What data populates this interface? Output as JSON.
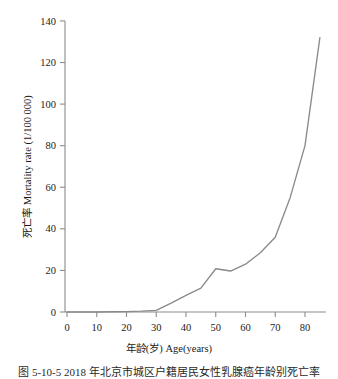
{
  "chart_data": {
    "type": "line",
    "title": "",
    "xlabel": "年龄(岁) Age(years)",
    "ylabel": "死亡率 Mortality rate (1/100 000)",
    "xlim": [
      0,
      87
    ],
    "ylim": [
      0,
      140
    ],
    "xticks": [
      0,
      10,
      20,
      30,
      40,
      50,
      60,
      70,
      80
    ],
    "yticks": [
      0,
      20,
      40,
      60,
      80,
      100,
      120,
      140
    ],
    "xtick_labels": [
      "0",
      "10",
      "20",
      "30",
      "40",
      "50",
      "60",
      "70",
      "80"
    ],
    "ytick_labels": [
      "0",
      "20",
      "40",
      "60",
      "80",
      "100",
      "120",
      "140"
    ],
    "grid": false,
    "legend": false,
    "line_color": "#8a8a8a",
    "axis_color": "#8c8c8c",
    "series": [
      {
        "name": "Mortality rate",
        "x": [
          0,
          5,
          10,
          15,
          20,
          25,
          30,
          35,
          40,
          45,
          50,
          55,
          60,
          65,
          70,
          75,
          80,
          85
        ],
        "values": [
          0.0,
          0.0,
          0.0,
          0.1,
          0.2,
          0.4,
          0.8,
          4.3,
          8.0,
          11.5,
          20.8,
          19.7,
          23.0,
          28.5,
          36.0,
          55.0,
          80.0,
          132.0
        ]
      }
    ]
  },
  "caption": {
    "text": "图 5-10-5  2018 年北京市城区户籍居民女性乳腺癌年龄别死亡率"
  }
}
